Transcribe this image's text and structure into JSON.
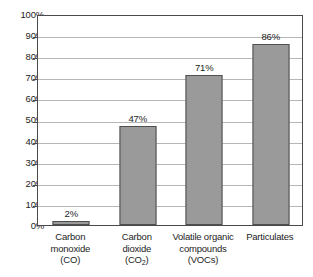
{
  "chart_data": {
    "type": "bar",
    "title": "",
    "subtitle": "",
    "xlabel": "",
    "ylabel": "",
    "categories": [
      "Carbon monoxide (CO)",
      "Carbon dioxide (CO2)",
      "Volatile organic compounds (VOCs)",
      "Particulates"
    ],
    "category_lines": [
      [
        "Carbon",
        "monoxide",
        "(CO)"
      ],
      [
        "Carbon",
        "dioxide",
        "(CO",
        "2",
        ")"
      ],
      [
        "Volatile organic",
        "compounds",
        "(VOCs)"
      ],
      [
        "Particulates"
      ]
    ],
    "values": [
      2,
      47,
      71,
      86
    ],
    "value_labels": [
      "2%",
      "47%",
      "71%",
      "86%"
    ],
    "ylim": [
      0,
      100
    ],
    "ytick_values": [
      0,
      10,
      20,
      30,
      40,
      50,
      60,
      70,
      80,
      90,
      100
    ],
    "ytick_labels": [
      "0%",
      "10%",
      "20%",
      "30%",
      "40%",
      "50%",
      "60%",
      "70%",
      "80%",
      "90%",
      "100%"
    ],
    "grid": true,
    "legend": false,
    "legend_position": "none",
    "bar_fill_color": "#9a9a9a",
    "bar_border_color": "#4f4f4f",
    "gridline_color": "#b6b6b6",
    "axis_color": "#4a4a4a",
    "background_color": "#ffffff",
    "text_color": "#1d1d1d"
  },
  "labels": {
    "cat0_l0": "Carbon",
    "cat0_l1": "monoxide",
    "cat0_l2": "(CO)",
    "cat1_l0": "Carbon",
    "cat1_l1": "dioxide",
    "cat1_l2a": "(CO",
    "cat1_l2b": "2",
    "cat1_l2c": ")",
    "cat2_l0": "Volatile organic",
    "cat2_l1": "compounds",
    "cat2_l2": "(VOCs)",
    "cat3_l0": "Particulates",
    "val0": "2%",
    "val1": "47%",
    "val2": "71%",
    "val3": "86%",
    "y0": "0%",
    "y10": "10%",
    "y20": "20%",
    "y30": "30%",
    "y40": "40%",
    "y50": "50%",
    "y60": "60%",
    "y70": "70%",
    "y80": "80%",
    "y90": "90%",
    "y100": "100%"
  }
}
